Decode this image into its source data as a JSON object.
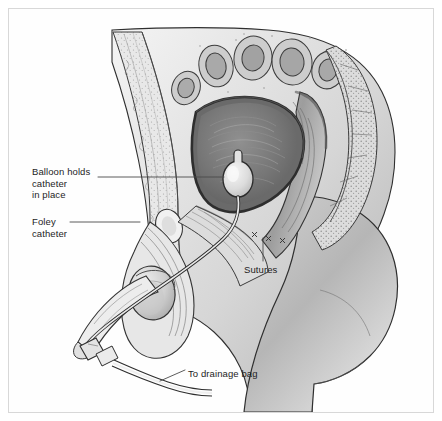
{
  "figure": {
    "border_color": "#d8d8d8",
    "background_color": "#ffffff",
    "ink_color": "#1d1d1d",
    "style": "grayscale medical line illustration"
  },
  "labels": {
    "balloon": "Balloon holds\ncatheter\nin place",
    "balloon_line1": "Balloon holds",
    "balloon_line2": "catheter",
    "balloon_line3": "in place",
    "foley": "Foley\ncatheter",
    "foley_line1": "Foley",
    "foley_line2": "catheter",
    "sutures": "Sutures",
    "drainage": "To drainage bag"
  },
  "anatomy": {
    "parts": [
      "intestinal loops",
      "bladder",
      "rectum",
      "sacrum",
      "pubic bone",
      "penis",
      "scrotum",
      "testis",
      "buttock",
      "thigh",
      "abdominal wall"
    ]
  },
  "device": {
    "name": "Foley catheter",
    "components": [
      "retention balloon",
      "catheter shaft",
      "connector",
      "drainage tubing"
    ]
  },
  "palette": {
    "outline": "#2a2a2a",
    "tissue_light": "#ebebeb",
    "tissue_mid": "#c9c9c9",
    "tissue_dark": "#8f8f8f",
    "cavity_dark": "#6e6e6e",
    "balloon": "#e4e4e4",
    "leader_line": "#4a4a4a"
  }
}
